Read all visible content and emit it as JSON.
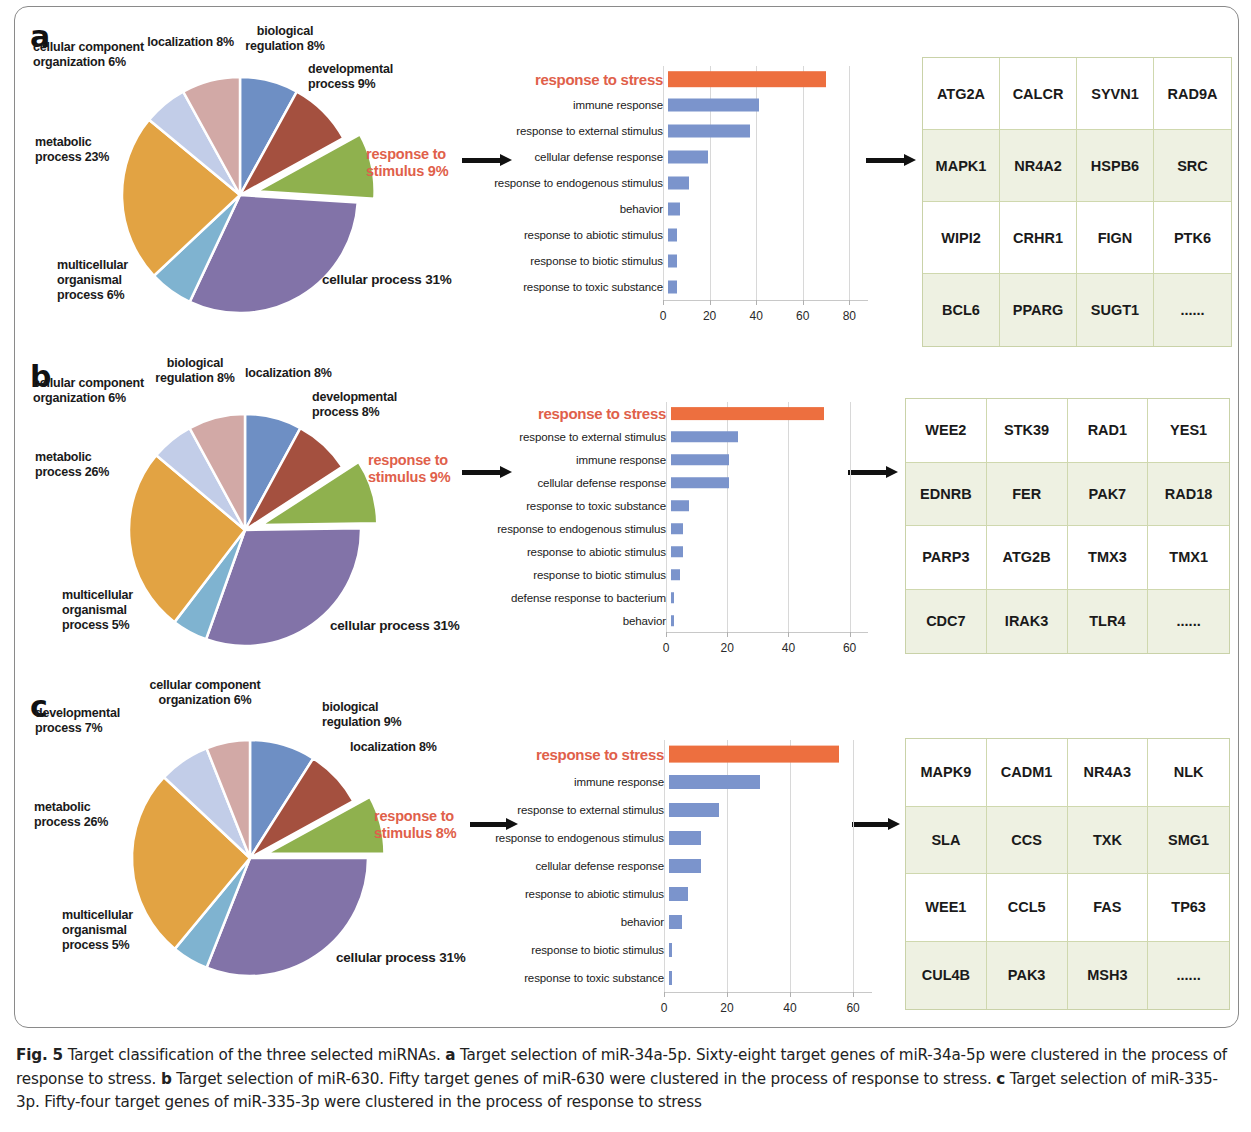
{
  "figure": {
    "caption_prefix": "Fig. 5",
    "caption_text": " Target classification of the three selected miRNAs. ",
    "caption_a_letter": "a",
    "caption_a_text": " Target selection of miR-34a-5p. Sixty-eight target genes of miR-34a-5p were clustered in the process of response to stress. ",
    "caption_b_letter": "b",
    "caption_b_text": " Target selection of miR-630. Fifty target genes of miR-630 were clustered in the process of response to stress. ",
    "caption_c_letter": "c",
    "caption_c_text": " Target selection of miR-335-3p. Fifty-four target genes of miR-335-3p were clustered in the process of response to stress"
  },
  "colors": {
    "blue": "#6e8fc4",
    "brick": "#a4503f",
    "green": "#8fb14e",
    "purple": "#8273a8",
    "lightblue": "#7fb3d0",
    "orange_pie": "#e2a343",
    "periwinkle": "#c2cde8",
    "rose": "#d2a9a6",
    "bar_blue": "#7b94cc",
    "bar_orange": "#ed6f3f",
    "highlight_red": "#e0604a",
    "table_border": "#cfd8ae",
    "table_shade": "#eef1e2"
  },
  "panels": [
    {
      "letter": "a",
      "pie_title": "Target selection of miR-34a-5p",
      "pie_highlight": "response to\nstimulus 9%",
      "pie_slices": [
        {
          "label": "biological\nregulation 8%",
          "value": 8,
          "color": "#6e8fc4",
          "exploded": false
        },
        {
          "label": "developmental\nprocess 9%",
          "value": 9,
          "color": "#a4503f",
          "exploded": false
        },
        {
          "label": "response to stimulus 9%",
          "value": 9,
          "color": "#8fb14e",
          "exploded": true
        },
        {
          "label": "cellular process 31%",
          "value": 31,
          "color": "#8273a8",
          "exploded": false
        },
        {
          "label": "multicellular\norganismal\nprocess 6%",
          "value": 6,
          "color": "#7fb3d0",
          "exploded": false
        },
        {
          "label": "metabolic\nprocess 23%",
          "value": 23,
          "color": "#e2a343",
          "exploded": false
        },
        {
          "label": "cellular component\norganization 6%",
          "value": 6,
          "color": "#c2cde8",
          "exploded": false
        },
        {
          "label": "localization 8%",
          "value": 8,
          "color": "#d2a9a6",
          "exploded": false
        }
      ],
      "chart_data": {
        "type": "bar",
        "orientation": "horizontal",
        "title": "",
        "xlabel": "",
        "ylabel": "",
        "xlim": [
          0,
          88
        ],
        "xticks": [
          0,
          20,
          40,
          60,
          80
        ],
        "grid": true,
        "categories": [
          "response to stress",
          "immune response",
          "response to external stimulus",
          "cellular defense response",
          "response to endogenous stimulus",
          "behavior",
          "response to abiotic stimulus",
          "response to biotic stimulus",
          "response to toxic substance"
        ],
        "values": [
          68,
          39,
          35,
          17,
          9,
          5,
          4,
          4,
          4
        ],
        "highlight_index": 0
      },
      "genes": [
        [
          "ATG2A",
          "CALCR",
          "SYVN1",
          "RAD9A"
        ],
        [
          "MAPK1",
          "NR4A2",
          "HSPB6",
          "SRC"
        ],
        [
          "WIPI2",
          "CRHR1",
          "FIGN",
          "PTK6"
        ],
        [
          "BCL6",
          "PPARG",
          "SUGT1",
          "......"
        ]
      ]
    },
    {
      "letter": "b",
      "pie_title": "Target selection of miR-630",
      "pie_highlight": "response to\nstimulus 9%",
      "pie_slices": [
        {
          "label": "localization 8%",
          "value": 8,
          "color": "#6e8fc4",
          "exploded": false
        },
        {
          "label": "developmental\nprocess 8%",
          "value": 8,
          "color": "#a4503f",
          "exploded": false
        },
        {
          "label": "response to stimulus 9%",
          "value": 9,
          "color": "#8fb14e",
          "exploded": true
        },
        {
          "label": "cellular process 31%",
          "value": 31,
          "color": "#8273a8",
          "exploded": false
        },
        {
          "label": "multicellular\norganismal\nprocess  5%",
          "value": 5,
          "color": "#7fb3d0",
          "exploded": false
        },
        {
          "label": "metabolic\nprocess 26%",
          "value": 26,
          "color": "#e2a343",
          "exploded": false
        },
        {
          "label": "cellular component\norganization 6%",
          "value": 6,
          "color": "#c2cde8",
          "exploded": false
        },
        {
          "label": "biological\nregulation 8%",
          "value": 8,
          "color": "#d2a9a6",
          "exploded": false
        }
      ],
      "chart_data": {
        "type": "bar",
        "orientation": "horizontal",
        "title": "",
        "xlabel": "",
        "ylabel": "",
        "xlim": [
          0,
          66
        ],
        "xticks": [
          0,
          20,
          40,
          60
        ],
        "grid": true,
        "categories": [
          "response to stress",
          "response to external stimulus",
          "immune response",
          "cellular defense response",
          "response to toxic substance",
          "response to endogenous stimulus",
          "response to abiotic stimulus",
          "response to biotic stimulus",
          "defense response to bacterium",
          "behavior"
        ],
        "values": [
          50,
          22,
          19,
          19,
          6,
          4,
          4,
          3,
          1,
          1
        ],
        "highlight_index": 0
      },
      "genes": [
        [
          "WEE2",
          "STK39",
          "RAD1",
          "YES1"
        ],
        [
          "EDNRB",
          "FER",
          "PAK7",
          "RAD18"
        ],
        [
          "PARP3",
          "ATG2B",
          "TMX3",
          "TMX1"
        ],
        [
          "CDC7",
          "IRAK3",
          "TLR4",
          "......"
        ]
      ]
    },
    {
      "letter": "c",
      "pie_title": "Target selection of miR-335-3p",
      "pie_highlight": "response to\nstimulus 8%",
      "pie_slices": [
        {
          "label": "biological\nregulation 9%",
          "value": 9,
          "color": "#6e8fc4",
          "exploded": false
        },
        {
          "label": "localization 8%",
          "value": 8,
          "color": "#a4503f",
          "exploded": false
        },
        {
          "label": "response to stimulus 8%",
          "value": 8,
          "color": "#8fb14e",
          "exploded": true
        },
        {
          "label": "cellular process 31%",
          "value": 31,
          "color": "#8273a8",
          "exploded": false
        },
        {
          "label": "multicellular\norganismal\nprocess  5%",
          "value": 5,
          "color": "#7fb3d0",
          "exploded": false
        },
        {
          "label": "metabolic\nprocess 26%",
          "value": 26,
          "color": "#e2a343",
          "exploded": false
        },
        {
          "label": "developmental\nprocess  7%",
          "value": 7,
          "color": "#c2cde8",
          "exploded": false
        },
        {
          "label": "cellular component\norganization  6%",
          "value": 6,
          "color": "#d2a9a6",
          "exploded": false
        }
      ],
      "chart_data": {
        "type": "bar",
        "orientation": "horizontal",
        "title": "",
        "xlabel": "",
        "ylabel": "",
        "xlim": [
          0,
          66
        ],
        "xticks": [
          0,
          20,
          40,
          60
        ],
        "grid": true,
        "categories": [
          "response to stress",
          "immune response",
          "response to external stimulus",
          "response to endogenous stimulus",
          "cellular defense response",
          "response to abiotic stimulus",
          "behavior",
          "response to biotic stimulus",
          "response to toxic substance"
        ],
        "values": [
          54,
          29,
          16,
          10,
          10,
          6,
          4,
          1,
          1
        ],
        "highlight_index": 0
      },
      "genes": [
        [
          "MAPK9",
          "CADM1",
          "NR4A3",
          "NLK"
        ],
        [
          "SLA",
          "CCS",
          "TXK",
          "SMG1"
        ],
        [
          "WEE1",
          "CCL5",
          "FAS",
          "TP63"
        ],
        [
          "CUL4B",
          "PAK3",
          "MSH3",
          "......"
        ]
      ]
    }
  ]
}
